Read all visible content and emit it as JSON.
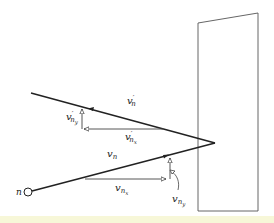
{
  "diagram": {
    "colors": {
      "stroke": "#222222",
      "wall": "#555555",
      "background": "#ffffff",
      "highlight": "#f7f7d8"
    },
    "particle_label": "n",
    "labels": {
      "v_n": {
        "base": "v",
        "sub": "n"
      },
      "v_nx": {
        "base": "v",
        "sub": "n",
        "subsub": "x"
      },
      "v_ny": {
        "base": "v",
        "sub": "n",
        "subsub": "y"
      },
      "vp_n": {
        "base": "v",
        "prime": "′",
        "sub": "n"
      },
      "vp_nx": {
        "base": "v",
        "prime": "′",
        "sub": "n",
        "subsub": "x"
      },
      "vp_ny": {
        "base": "v",
        "prime": "′",
        "sub": "n",
        "subsub": "y"
      }
    }
  }
}
